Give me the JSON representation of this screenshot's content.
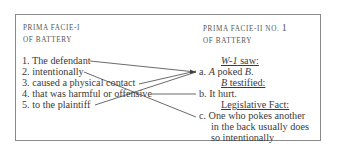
{
  "left": {
    "heading_line1": "PRIMA FACIE-I",
    "heading_line2": "OF BATTERY",
    "elements": [
      "1. The defendant",
      "2. intentionally",
      "3. caused a physical contact",
      "4. that was harmful or offensive",
      "5. to the plaintiff"
    ]
  },
  "right": {
    "heading_line1": "PRIMA FACIE-II NO.",
    "heading_number": "1",
    "heading_line2": "OF BATTERY",
    "groups": [
      {
        "source_name": "W-1",
        "source_verb": " saw:",
        "fact_prefix": "a. ",
        "fact_a": "A",
        "fact_mid": " poked ",
        "fact_b": "B",
        "fact_end": "."
      },
      {
        "source_name": "B",
        "source_verb": " testified:",
        "fact": "b. It hurt."
      },
      {
        "source": "Legislative Fact:",
        "fact_lines": [
          "c. One who pokes another",
          "in the back usually does",
          "so intentionally"
        ]
      }
    ]
  },
  "connections": [
    {
      "from": 1,
      "to": "a"
    },
    {
      "from": 2,
      "to": "c"
    },
    {
      "from": 3,
      "to": "a"
    },
    {
      "from": 4,
      "to": "b"
    },
    {
      "from": 5,
      "to": "a"
    }
  ],
  "colors": {
    "border": "#8a8a8a",
    "text": "#3a3a3a",
    "lines": "#444444"
  }
}
